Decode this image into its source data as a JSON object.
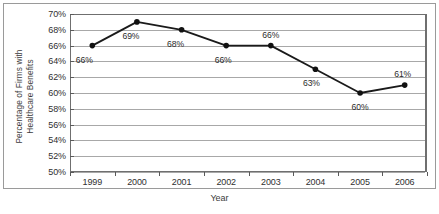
{
  "chart_data": {
    "type": "line",
    "title": "",
    "xlabel": "Year",
    "ylabel": "Percentage of Firms with\nHealthcare Benefits",
    "categories": [
      "1999",
      "2000",
      "2001",
      "2002",
      "2003",
      "2004",
      "2005",
      "2006"
    ],
    "values": [
      66,
      69,
      68,
      66,
      66,
      63,
      60,
      61
    ],
    "point_labels": [
      "66%",
      "69%",
      "68%",
      "66%",
      "66%",
      "63%",
      "60%",
      "61%"
    ],
    "ylim": [
      50,
      70
    ],
    "ytick_values": [
      70,
      68,
      66,
      64,
      62,
      60,
      58,
      56,
      54,
      52,
      50
    ],
    "ytick_labels": [
      "70%",
      "68%",
      "66%",
      "64%",
      "62%",
      "60%",
      "58%",
      "56%",
      "54%",
      "52%",
      "50%"
    ],
    "grid": true,
    "legend": "none",
    "series_color": "#1a1a1a",
    "marker": "circle",
    "marker_color": "#111111",
    "gridline_color": "#a8a8a8",
    "axis_color": "#6f6f6f",
    "border_color": "#9a9a9a",
    "background": "#ffffff"
  }
}
